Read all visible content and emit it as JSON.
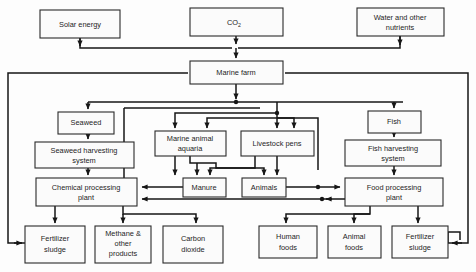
{
  "diagram": {
    "colors": {
      "line": "#161616",
      "box_fill": "#fbfbfb",
      "box_stroke": "#2a2a2a",
      "background": "#fdfdfd"
    },
    "nodes": [
      {
        "id": "solar_energy",
        "label": "Solar energy",
        "x": 40,
        "y": 10,
        "w": 80,
        "h": 28
      },
      {
        "id": "co2_input",
        "label": "CO",
        "sub": "2",
        "x": 190,
        "y": 8,
        "w": 93,
        "h": 28
      },
      {
        "id": "water_nutrients",
        "label": "Water and other",
        "label2": "nutrients",
        "x": 357,
        "y": 8,
        "w": 87,
        "h": 28
      },
      {
        "id": "marine_farm",
        "label": "Marine farm",
        "x": 190,
        "y": 61,
        "w": 93,
        "h": 23
      },
      {
        "id": "seaweed",
        "label": "Seaweed",
        "x": 58,
        "y": 112,
        "w": 56,
        "h": 22
      },
      {
        "id": "fish",
        "label": "Fish",
        "x": 368,
        "y": 111,
        "w": 53,
        "h": 22
      },
      {
        "id": "marine_aquaria",
        "label": "Marine animal",
        "label2": "aquaria",
        "x": 155,
        "y": 131,
        "w": 71,
        "h": 25
      },
      {
        "id": "livestock_pens",
        "label": "Livestock pens",
        "x": 241,
        "y": 131,
        "w": 73,
        "h": 25
      },
      {
        "id": "seaweed_harvest",
        "label": "Seaweed harvesting",
        "label2": "system",
        "x": 35,
        "y": 142,
        "w": 99,
        "h": 26
      },
      {
        "id": "fish_harvest",
        "label": "Fish harvesting",
        "label2": "system",
        "x": 345,
        "y": 140,
        "w": 96,
        "h": 26
      },
      {
        "id": "manure",
        "label": "Manure",
        "x": 183,
        "y": 178,
        "w": 43,
        "h": 19
      },
      {
        "id": "animals",
        "label": "Animals",
        "x": 242,
        "y": 178,
        "w": 44,
        "h": 19
      },
      {
        "id": "chemical_plant",
        "label": "Chemical processing",
        "label2": "plant",
        "x": 36,
        "y": 178,
        "w": 101,
        "h": 28
      },
      {
        "id": "food_plant",
        "label": "Food processing",
        "label2": "plant",
        "x": 345,
        "y": 178,
        "w": 98,
        "h": 28
      },
      {
        "id": "fertilizer_left",
        "label": "Fertilizer",
        "label2": "sludge",
        "x": 25,
        "y": 226,
        "w": 60,
        "h": 37
      },
      {
        "id": "methane",
        "label": "Methane &",
        "label2": "other",
        "label3": "products",
        "x": 95,
        "y": 226,
        "w": 56,
        "h": 37
      },
      {
        "id": "carbon_dioxide",
        "label": "Carbon",
        "label2": "dioxide",
        "x": 163,
        "y": 226,
        "w": 60,
        "h": 37
      },
      {
        "id": "human_foods",
        "label": "Human",
        "label2": "foods",
        "x": 259,
        "y": 226,
        "w": 58,
        "h": 32
      },
      {
        "id": "animal_foods",
        "label": "Animal",
        "label2": "foods",
        "x": 328,
        "y": 226,
        "w": 53,
        "h": 32
      },
      {
        "id": "fertilizer_right",
        "label": "Fertilizer",
        "label2": "sludge",
        "x": 392,
        "y": 226,
        "w": 56,
        "h": 32
      }
    ],
    "edges": [
      {
        "id": "solar-to-bus",
        "from": "solar_energy",
        "to": "marine_farm"
      },
      {
        "id": "co2-to-marine-farm",
        "from": "co2_input",
        "to": "marine_farm"
      },
      {
        "id": "water-to-bus",
        "from": "water_nutrients",
        "to": "marine_farm"
      },
      {
        "id": "farm-to-seaweed",
        "from": "marine_farm",
        "to": "seaweed"
      },
      {
        "id": "farm-to-aquaria",
        "from": "marine_farm",
        "to": "marine_aquaria"
      },
      {
        "id": "farm-to-livestock",
        "from": "marine_farm",
        "to": "livestock_pens"
      },
      {
        "id": "farm-to-fish",
        "from": "marine_farm",
        "to": "fish"
      },
      {
        "id": "seaweed-to-harvest",
        "from": "seaweed",
        "to": "seaweed_harvest"
      },
      {
        "id": "fish-to-harvest",
        "from": "fish",
        "to": "fish_harvest"
      },
      {
        "id": "harvest-to-chemical",
        "from": "seaweed_harvest",
        "to": "chemical_plant"
      },
      {
        "id": "fishharvest-to-food",
        "from": "fish_harvest",
        "to": "food_plant"
      },
      {
        "id": "aquaria-to-manure",
        "from": "marine_aquaria",
        "to": "manure"
      },
      {
        "id": "aquaria-to-animals",
        "from": "marine_aquaria",
        "to": "animals"
      },
      {
        "id": "livestock-to-manure",
        "from": "livestock_pens",
        "to": "manure"
      },
      {
        "id": "livestock-to-animals",
        "from": "livestock_pens",
        "to": "animals"
      },
      {
        "id": "manure-to-chemical",
        "from": "manure",
        "to": "chemical_plant"
      },
      {
        "id": "animals-to-food",
        "from": "animals",
        "to": "food_plant"
      },
      {
        "id": "food-to-chemical",
        "from": "food_plant",
        "to": "chemical_plant"
      },
      {
        "id": "chemical-to-fert",
        "from": "chemical_plant",
        "to": "fertilizer_left"
      },
      {
        "id": "chemical-to-methane",
        "from": "chemical_plant",
        "to": "methane"
      },
      {
        "id": "chemical-to-co2",
        "from": "chemical_plant",
        "to": "carbon_dioxide"
      },
      {
        "id": "food-to-human",
        "from": "food_plant",
        "to": "human_foods"
      },
      {
        "id": "food-to-animalfoods",
        "from": "food_plant",
        "to": "animal_foods"
      },
      {
        "id": "food-to-fertilizer",
        "from": "food_plant",
        "to": "fertilizer_right"
      },
      {
        "id": "recycle-left",
        "from": "fertilizer_left",
        "to": "marine_farm"
      },
      {
        "id": "recycle-right",
        "from": "fertilizer_right",
        "to": "marine_farm"
      }
    ]
  }
}
